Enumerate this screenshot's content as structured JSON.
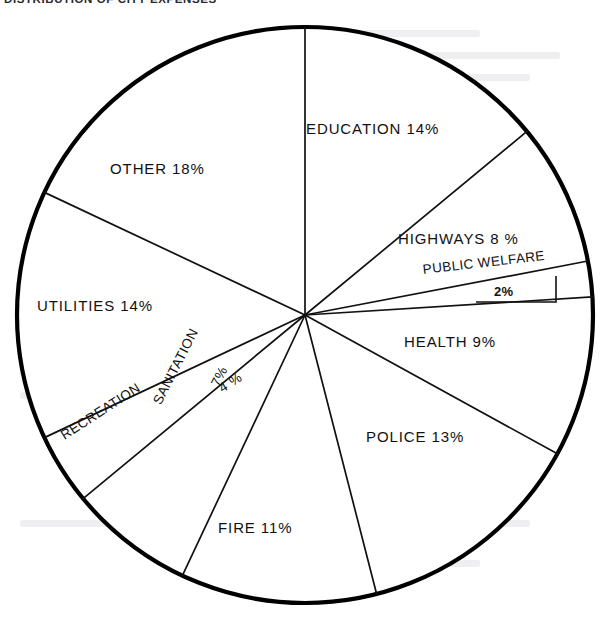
{
  "title": "DISTRIBUTION OF CITY EXPENSES",
  "chart_data": {
    "type": "pie",
    "title": "DISTRIBUTION OF CITY EXPENSES",
    "units": "percent",
    "start_angle_deg": 0,
    "direction": "clockwise",
    "total": 100,
    "center": {
      "x": 305,
      "y": 315
    },
    "radius": 288,
    "grid": false,
    "legend": "none",
    "labels_placement": "inside-slice",
    "categories": [
      "EDUCATION",
      "HIGHWAYS",
      "PUBLIC WELFARE",
      "HEALTH",
      "POLICE",
      "FIRE",
      "SANITATION",
      "RECREATION",
      "UTILITIES",
      "OTHER"
    ],
    "values": [
      14,
      8,
      2,
      9,
      13,
      11,
      7,
      4,
      14,
      18
    ],
    "slices": [
      {
        "label": "EDUCATION",
        "value": 14,
        "pct_text": "14%",
        "label_text": "EDUCATION 14%"
      },
      {
        "label": "HIGHWAYS",
        "value": 8,
        "pct_text": "8 %",
        "label_text": "HIGHWAYS  8 %"
      },
      {
        "label": "PUBLIC WELFARE",
        "value": 2,
        "pct_text": "2%",
        "label_text": "PUBLIC WELFARE 2%"
      },
      {
        "label": "HEALTH",
        "value": 9,
        "pct_text": "9%",
        "label_text": "HEALTH 9%"
      },
      {
        "label": "POLICE",
        "value": 13,
        "pct_text": "13%",
        "label_text": "POLICE  13%"
      },
      {
        "label": "FIRE",
        "value": 11,
        "pct_text": "11%",
        "label_text": "FIRE  11%"
      },
      {
        "label": "SANITATION",
        "value": 7,
        "pct_text": "7%",
        "label_text": "SANITATION 7%"
      },
      {
        "label": "RECREATION",
        "value": 4,
        "pct_text": "4 %",
        "label_text": "RECREATION 4 %"
      },
      {
        "label": "UTILITIES",
        "value": 14,
        "pct_text": "14%",
        "label_text": "UTILITIES  14%"
      },
      {
        "label": "OTHER",
        "value": 18,
        "pct_text": "18%",
        "label_text": "OTHER  18%"
      }
    ],
    "colors": {
      "fill": "#ffffff",
      "stroke": "#111111",
      "outline": "#000000",
      "background": "#ffffff"
    }
  },
  "labels": {
    "education": "EDUCATION  14%",
    "highways": "HIGHWAYS   8 %",
    "public_welfare": "PUBLIC WELFARE",
    "public_welfare_pct": "2%",
    "health": "HEALTH  9%",
    "police": "POLICE   13%",
    "fire": "FIRE   11%",
    "sanitation": "SANITATION",
    "sanitation_pct": "7%",
    "recreation": "RECREATION",
    "recreation_pct": "4 %",
    "utilities": "UTILITIES   14%",
    "other": "OTHER   18%"
  }
}
